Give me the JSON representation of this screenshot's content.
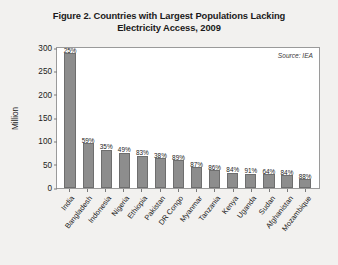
{
  "figure": {
    "title_line1": "Figure 2. Countries with Largest Populations Lacking",
    "title_line2": "Electricity Access, 2009",
    "source_note": "Source: IEA"
  },
  "chart_data": {
    "type": "bar",
    "title": "Figure 2. Countries with Largest Populations Lacking Electricity Access, 2009",
    "xlabel": "",
    "ylabel": "Million",
    "ylim": [
      0,
      300
    ],
    "yticks": [
      0,
      50,
      100,
      150,
      200,
      250,
      300
    ],
    "ytick_labels": [
      "0",
      "50",
      "100",
      "150",
      "200",
      "250",
      "300"
    ],
    "grid": false,
    "legend": null,
    "annotations": [
      "Source: IEA"
    ],
    "bar_color": "#8d8d8d",
    "categories": [
      "India",
      "Bangladesh",
      "Indonesia",
      "Nigeria",
      "Ethiopia",
      "Pakistan",
      "DR Congo",
      "Myanmar",
      "Tanzania",
      "Kenya",
      "Uganda",
      "Sudan",
      "Afghanistan",
      "Mozambique"
    ],
    "values": [
      289,
      96,
      82,
      76,
      69,
      64,
      59,
      44,
      38,
      33,
      31,
      30,
      27,
      19
    ],
    "data_labels": [
      "25%",
      "59%",
      "35%",
      "49%",
      "83%",
      "38%",
      "89%",
      "87%",
      "86%",
      "84%",
      "91%",
      "64%",
      "84%",
      "88%"
    ]
  }
}
